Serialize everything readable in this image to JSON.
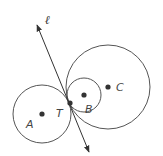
{
  "diagram": {
    "line": {
      "label": "ℓ",
      "x1": 37,
      "y1": 24,
      "x2": 89,
      "y2": 153
    },
    "circles": [
      {
        "name": "A",
        "cx": 42,
        "cy": 114,
        "r": 29
      },
      {
        "name": "B",
        "cx": 84,
        "cy": 95,
        "r": 17
      },
      {
        "name": "C",
        "cx": 108,
        "cy": 87,
        "r": 42
      }
    ],
    "points": [
      {
        "label": "A",
        "x": 42,
        "y": 114
      },
      {
        "label": "T",
        "x": 70,
        "y": 103
      },
      {
        "label": "B",
        "x": 84,
        "y": 95
      },
      {
        "label": "C",
        "x": 108,
        "y": 87
      }
    ],
    "labels": {
      "ell": "ℓ",
      "A": "A",
      "T": "T",
      "B": "B",
      "C": "C"
    },
    "colors": {
      "stroke": "#555555",
      "point": "#333333"
    }
  }
}
